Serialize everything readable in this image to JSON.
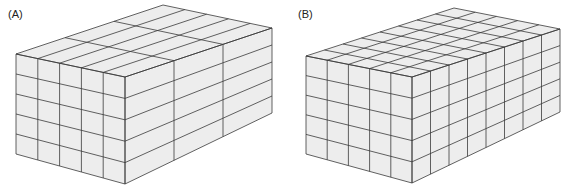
{
  "figure": {
    "panels": [
      {
        "id": "A",
        "label": "(A)",
        "description": "Stack of elongated rectangular blocks",
        "front_columns": 5,
        "rows": 5,
        "depth_segments": 3,
        "face_color": "#ededed",
        "line_color": "#333333"
      },
      {
        "id": "B",
        "label": "(B)",
        "description": "Stack of cubes",
        "front_columns": 5,
        "rows": 5,
        "depth_segments": 8,
        "face_color": "#ededed",
        "line_color": "#333333"
      }
    ]
  }
}
